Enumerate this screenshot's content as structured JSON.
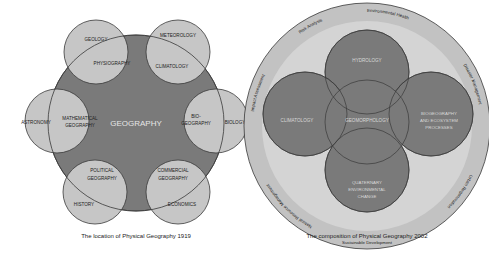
{
  "diagrams": [
    {
      "caption": "The location of Physical Geography 1919",
      "center_label": "GEOGRAPHY",
      "satellites": [
        {
          "outer": "GEOLOGY",
          "overlap": "PHYSIOGRAPHY"
        },
        {
          "outer": "METEOROLOGY",
          "overlap": "CLIMATOLOGY"
        },
        {
          "outer": "ASTRONOMY",
          "overlap_line1": "MATHEMATICAL",
          "overlap_line2": "GEOGRAPHY"
        },
        {
          "outer": "BIOLOGY",
          "overlap_line1": "BIO-",
          "overlap_line2": "GEOGRAPHY"
        },
        {
          "outer": "HISTORY",
          "overlap_line1": "POLITICAL",
          "overlap_line2": "GEOGRAPHY"
        },
        {
          "outer": "ECONOMICS",
          "overlap_line1": "COMMERCIAL",
          "overlap_line2": "GEOGRAPHY"
        }
      ]
    },
    {
      "caption": "The composition of Physical Geography 2002",
      "inner_circles": [
        {
          "label": "HYDROLOGY"
        },
        {
          "label": "CLIMATOLOGY"
        },
        {
          "label": "GEOMORPHOLOGY"
        },
        {
          "line1": "BIOGEOGRAPHY",
          "line2": "AND ECOSYSTEM",
          "line3": "PROCESSES"
        },
        {
          "line1": "QUATERNARY",
          "line2": "ENVIRONMENTAL",
          "line3": "CHANGE"
        }
      ],
      "ring_labels": [
        "Impact Assessment",
        "Risk Analysis",
        "Environmental Health",
        "Disaster Management",
        "Urban Regeneration",
        "Sustainable Development",
        "Natural Resource Management"
      ]
    }
  ],
  "colors": {
    "dark_fill": "#7a7a7a",
    "light_fill": "#c6c6c6",
    "ring_fill": "#c2c2c2",
    "stroke": "#3a3a3a"
  }
}
